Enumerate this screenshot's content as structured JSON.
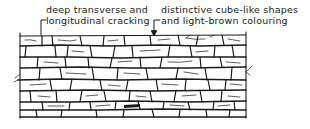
{
  "figure": {
    "type": "line-drawing"
  },
  "annotations": [
    {
      "id": "left",
      "line1": "deep transverse and",
      "line2": "longitudinal cracking"
    },
    {
      "id": "right",
      "line1": "distinctive cube-like shapes",
      "line2": "and light-brown colouring"
    }
  ],
  "colors": {
    "ink": "#1a1a1a",
    "background": "#ffffff"
  }
}
